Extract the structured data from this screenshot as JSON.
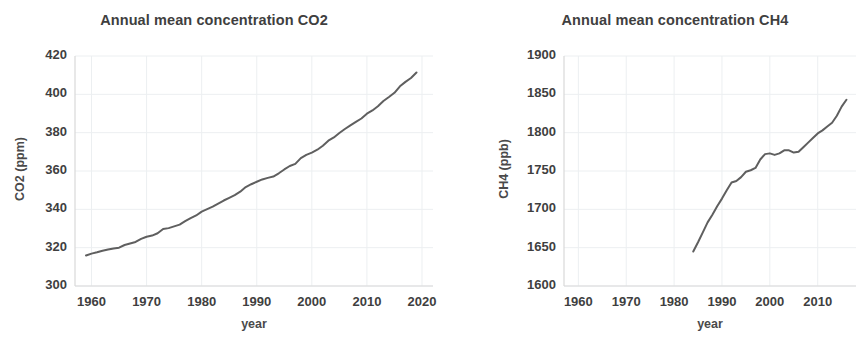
{
  "figure": {
    "background": "#ffffff",
    "line_color": "#5f5f5f",
    "grid_color": "#eceff1",
    "axis_color": "#d9d9d9",
    "text_color": "#3f3f3f"
  },
  "panels": [
    {
      "id": "co2",
      "title": "Annual mean concentration CO2",
      "xlabel": "year",
      "ylabel": "CO2 (ppm)",
      "y_ticks": [
        "300",
        "320",
        "340",
        "360",
        "380",
        "400",
        "420"
      ],
      "x_ticks": [
        "1960",
        "1970",
        "1980",
        "1990",
        "2000",
        "2010",
        "2020"
      ]
    },
    {
      "id": "ch4",
      "title": "Annual mean concentration CH4",
      "xlabel": "year",
      "ylabel": "CH4 (ppb)",
      "y_ticks": [
        "1600",
        "1650",
        "1700",
        "1750",
        "1800",
        "1850",
        "1900"
      ],
      "x_ticks": [
        "1960",
        "1970",
        "1980",
        "1990",
        "2000",
        "2010"
      ]
    }
  ],
  "chart_data": [
    {
      "type": "line",
      "title": "Annual mean concentration CO2",
      "xlabel": "year",
      "ylabel": "CO2 (ppm)",
      "xlim": [
        1957,
        2022
      ],
      "ylim": [
        300,
        420
      ],
      "xticks": [
        1960,
        1970,
        1980,
        1990,
        2000,
        2010,
        2020
      ],
      "yticks": [
        300,
        320,
        340,
        360,
        380,
        400,
        420
      ],
      "grid": true,
      "legend": "none",
      "series": [
        {
          "name": "CO2 annual mean",
          "x": [
            1959,
            1960,
            1961,
            1962,
            1963,
            1964,
            1965,
            1966,
            1967,
            1968,
            1969,
            1970,
            1971,
            1972,
            1973,
            1974,
            1975,
            1976,
            1977,
            1978,
            1979,
            1980,
            1981,
            1982,
            1983,
            1984,
            1985,
            1986,
            1987,
            1988,
            1989,
            1990,
            1991,
            1992,
            1993,
            1994,
            1995,
            1996,
            1997,
            1998,
            1999,
            2000,
            2001,
            2002,
            2003,
            2004,
            2005,
            2006,
            2007,
            2008,
            2009,
            2010,
            2011,
            2012,
            2013,
            2014,
            2015,
            2016,
            2017,
            2018,
            2019
          ],
          "y": [
            315.9,
            316.9,
            317.6,
            318.4,
            319.0,
            319.6,
            320.0,
            321.4,
            322.2,
            323.0,
            324.6,
            325.7,
            326.3,
            327.5,
            329.7,
            330.2,
            331.1,
            332.0,
            333.8,
            335.4,
            336.8,
            338.8,
            340.1,
            341.4,
            343.0,
            344.6,
            346.0,
            347.4,
            349.2,
            351.6,
            353.1,
            354.4,
            355.6,
            356.4,
            357.1,
            358.8,
            360.8,
            362.6,
            363.7,
            366.7,
            368.4,
            369.6,
            371.1,
            373.2,
            375.8,
            377.5,
            379.8,
            381.9,
            383.8,
            385.6,
            387.4,
            389.9,
            391.6,
            393.8,
            396.5,
            398.6,
            400.8,
            404.2,
            406.5,
            408.5,
            411.4
          ]
        }
      ]
    },
    {
      "type": "line",
      "title": "Annual mean concentration CH4",
      "xlabel": "year",
      "ylabel": "CH4 (ppb)",
      "xlim": [
        1957,
        2018
      ],
      "ylim": [
        1600,
        1900
      ],
      "xticks": [
        1960,
        1970,
        1980,
        1990,
        2000,
        2010
      ],
      "yticks": [
        1600,
        1650,
        1700,
        1750,
        1800,
        1850,
        1900
      ],
      "grid": true,
      "legend": "none",
      "series": [
        {
          "name": "CH4 annual mean",
          "x": [
            1984,
            1985,
            1986,
            1987,
            1988,
            1989,
            1990,
            1991,
            1992,
            1993,
            1994,
            1995,
            1996,
            1997,
            1998,
            1999,
            2000,
            2001,
            2002,
            2003,
            2004,
            2005,
            2006,
            2007,
            2008,
            2009,
            2010,
            2011,
            2012,
            2013,
            2014,
            2015,
            2016
          ],
          "y": [
            1645,
            1657,
            1670,
            1683,
            1693,
            1704,
            1714,
            1725,
            1735,
            1737,
            1742,
            1749,
            1751,
            1754,
            1765,
            1772,
            1773,
            1771,
            1773,
            1777,
            1777,
            1774,
            1775,
            1781,
            1787,
            1793,
            1799,
            1803,
            1808,
            1813,
            1822,
            1834,
            1843
          ]
        }
      ]
    }
  ]
}
